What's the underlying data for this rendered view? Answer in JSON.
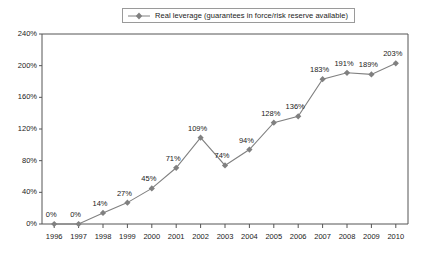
{
  "legend": {
    "entries": [
      {
        "label": "Real leverage (guarantees in force/risk reserve available)",
        "color": "#808080",
        "marker": "diamond"
      }
    ],
    "position": "top-center",
    "boxed": true
  },
  "colors": {
    "line": "#808080",
    "marker": "#808080",
    "axis": "#555555",
    "text": "#1a1a1a",
    "background": "#ffffff",
    "legend_border": "#9a9a9a"
  },
  "chart_data": {
    "type": "line",
    "title": "",
    "xlabel": "",
    "ylabel": "",
    "categories": [
      "1996",
      "1997",
      "1998",
      "1999",
      "2000",
      "2001",
      "2002",
      "2003",
      "2004",
      "2005",
      "2006",
      "2007",
      "2008",
      "2009",
      "2010"
    ],
    "values": [
      0,
      0,
      14,
      27,
      45,
      71,
      109,
      74,
      94,
      128,
      136,
      183,
      191,
      189,
      203
    ],
    "point_labels": [
      "0%",
      "0%",
      "14%",
      "27%",
      "45%",
      "71%",
      "109%",
      "74%",
      "94%",
      "128%",
      "136%",
      "183%",
      "191%",
      "189%",
      "203%"
    ],
    "series": [
      {
        "name": "Real leverage (guarantees in force/risk reserve available)",
        "values": [
          0,
          0,
          14,
          27,
          45,
          71,
          109,
          74,
          94,
          128,
          136,
          183,
          191,
          189,
          203
        ]
      }
    ],
    "ylim": [
      0,
      240
    ],
    "ytick_values": [
      0,
      40,
      80,
      120,
      160,
      200,
      240
    ],
    "ytick_labels": [
      "0%",
      "40%",
      "80%",
      "120%",
      "160%",
      "200%",
      "240%"
    ],
    "grid": false,
    "legend_position": "top-center",
    "units": "percent"
  }
}
